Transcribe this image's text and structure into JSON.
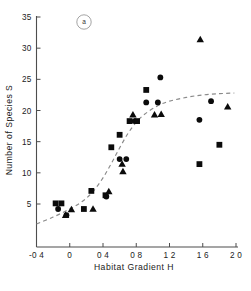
{
  "panel": {
    "tag": "a"
  },
  "chart_data": {
    "type": "scatter",
    "title": "",
    "xlabel": "Habitat Gradient H",
    "ylabel": "Number of Species S",
    "xlim": [
      -0.4,
      2.0
    ],
    "ylim": [
      0,
      35
    ],
    "xticks": [
      -0.4,
      0,
      0.4,
      0.8,
      1.2,
      1.6,
      2.0
    ],
    "xticklabels": [
      "-0 4",
      "0",
      "0 4",
      "0 8",
      "1 2",
      "1 6",
      "2 0"
    ],
    "yticks": [
      5,
      10,
      15,
      20,
      25,
      30,
      35
    ],
    "yticklabels": [
      "5",
      "10",
      "15",
      "20",
      "25",
      "30",
      "35"
    ],
    "grid": false,
    "legend": "none",
    "series": [
      {
        "name": "circle-markers",
        "marker": "circle",
        "color": "#0b0b0b",
        "points": [
          {
            "x": -0.14,
            "y": 4.2
          },
          {
            "x": -0.04,
            "y": 3.2
          },
          {
            "x": 0.44,
            "y": 6.2
          },
          {
            "x": 0.6,
            "y": 12.2
          },
          {
            "x": 0.68,
            "y": 12.2
          },
          {
            "x": 0.78,
            "y": 18.3
          },
          {
            "x": 0.92,
            "y": 21.3
          },
          {
            "x": 1.06,
            "y": 21.3
          },
          {
            "x": 1.09,
            "y": 25.3
          },
          {
            "x": 1.56,
            "y": 18.5
          },
          {
            "x": 1.7,
            "y": 21.5
          }
        ]
      },
      {
        "name": "square-markers",
        "marker": "square",
        "color": "#0b0b0b",
        "points": [
          {
            "x": -0.17,
            "y": 5.1
          },
          {
            "x": -0.1,
            "y": 5.1
          },
          {
            "x": 0.17,
            "y": 4.2
          },
          {
            "x": 0.26,
            "y": 7.1
          },
          {
            "x": 0.43,
            "y": 6.4
          },
          {
            "x": 0.5,
            "y": 14.1
          },
          {
            "x": 0.6,
            "y": 16.1
          },
          {
            "x": 0.72,
            "y": 18.3
          },
          {
            "x": 0.81,
            "y": 18.3
          },
          {
            "x": 0.92,
            "y": 23.3
          },
          {
            "x": 1.56,
            "y": 11.4
          },
          {
            "x": 1.8,
            "y": 14.5
          }
        ]
      },
      {
        "name": "triangle-markers",
        "marker": "triangle",
        "color": "#0b0b0b",
        "points": [
          {
            "x": -0.05,
            "y": 3.2
          },
          {
            "x": 0.02,
            "y": 4.1
          },
          {
            "x": 0.28,
            "y": 4.2
          },
          {
            "x": 0.47,
            "y": 7.0
          },
          {
            "x": 0.63,
            "y": 11.4
          },
          {
            "x": 0.64,
            "y": 10.2
          },
          {
            "x": 0.76,
            "y": 19.3
          },
          {
            "x": 1.02,
            "y": 19.3
          },
          {
            "x": 1.1,
            "y": 19.4
          },
          {
            "x": 1.57,
            "y": 31.4
          },
          {
            "x": 1.9,
            "y": 20.6
          }
        ]
      }
    ],
    "fit_curve": {
      "name": "fitted-logistic-curve",
      "style": "dashed",
      "color": "#8a8a8a",
      "points": [
        {
          "x": -0.4,
          "y": 1.8
        },
        {
          "x": -0.2,
          "y": 2.9
        },
        {
          "x": 0.0,
          "y": 4.2
        },
        {
          "x": 0.15,
          "y": 5.4
        },
        {
          "x": 0.28,
          "y": 7.0
        },
        {
          "x": 0.4,
          "y": 9.2
        },
        {
          "x": 0.5,
          "y": 11.5
        },
        {
          "x": 0.6,
          "y": 14.0
        },
        {
          "x": 0.7,
          "y": 16.3
        },
        {
          "x": 0.8,
          "y": 18.1
        },
        {
          "x": 0.9,
          "y": 19.4
        },
        {
          "x": 1.05,
          "y": 20.7
        },
        {
          "x": 1.2,
          "y": 21.5
        },
        {
          "x": 1.4,
          "y": 22.1
        },
        {
          "x": 1.6,
          "y": 22.5
        },
        {
          "x": 1.8,
          "y": 22.7
        },
        {
          "x": 1.98,
          "y": 22.8
        }
      ]
    }
  }
}
